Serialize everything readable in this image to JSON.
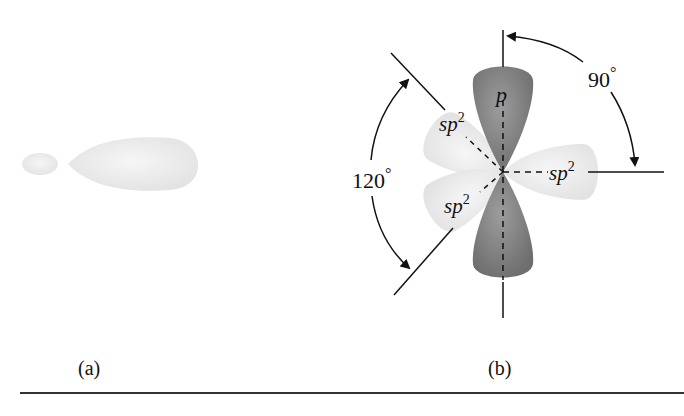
{
  "figure": {
    "panel_a": {
      "caption": "(a)",
      "description": "single sp2 hybrid orbital, small back lobe and large front lobe"
    },
    "panel_b": {
      "caption": "(b)",
      "labels": {
        "p_orbital": "p",
        "sp2_upper_left": "sp",
        "sp2_right": "sp",
        "sp2_lower_left": "sp",
        "superscript": "2",
        "angle_90": "90",
        "angle_120": "120",
        "degree": "°"
      }
    }
  },
  "colors": {
    "sp2_lobe": "#ececec",
    "p_lobe": "#8a8a8a",
    "line": "#111111"
  }
}
